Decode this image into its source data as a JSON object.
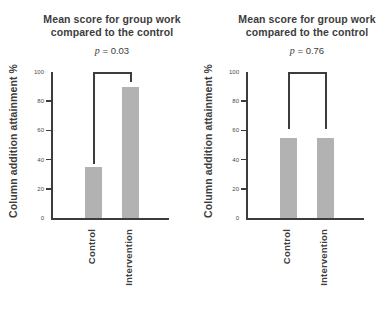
{
  "colors": {
    "bar_fill": "#b2b2b2",
    "axis": "#3c3c3c",
    "bracket": "#3c3c3c",
    "title_text": "#3d3d3d",
    "tick_label_text": "#4a4a4a"
  },
  "chart_data": [
    {
      "type": "bar",
      "title": "Mean score for group work compared to the control",
      "title_lines": [
        "Mean score for group work",
        "compared to the control"
      ],
      "p_annotation": {
        "symbol": "p",
        "rest": "= 0.03"
      },
      "ylabel": "Column addition attainment %",
      "xlabel": "",
      "categories": [
        "Control",
        "Intervention"
      ],
      "values": [
        35,
        90
      ],
      "ylim": [
        0,
        100
      ],
      "yticks": [
        0,
        20,
        40,
        60,
        80,
        100
      ],
      "grid": false,
      "legend": "none",
      "significance_bracket": {
        "between": [
          "Control",
          "Intervention"
        ],
        "top_value": 100,
        "left_drop_to_value": 37,
        "right_drop_to_value": 93
      }
    },
    {
      "type": "bar",
      "title": "Mean score for group work compared to the control",
      "title_lines": [
        "Mean score for group work",
        "compared to the control"
      ],
      "p_annotation": {
        "symbol": "p",
        "rest": "= 0.76"
      },
      "ylabel": "Column addition attainment %",
      "xlabel": "",
      "categories": [
        "Control",
        "Intervention"
      ],
      "values": [
        55,
        55
      ],
      "ylim": [
        0,
        100
      ],
      "yticks": [
        0,
        20,
        40,
        60,
        80,
        100
      ],
      "grid": false,
      "legend": "none",
      "significance_bracket": {
        "between": [
          "Control",
          "Intervention"
        ],
        "top_value": 100,
        "left_drop_to_value": 61,
        "right_drop_to_value": 61
      }
    }
  ]
}
